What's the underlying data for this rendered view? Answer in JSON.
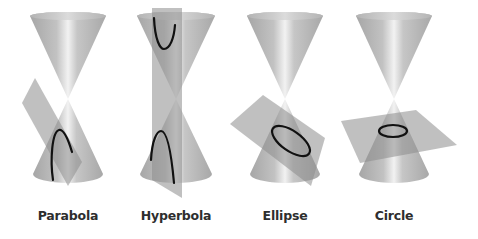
{
  "diagram": {
    "colors": {
      "background": "#ffffff",
      "cone_edge": "#a6a6a6",
      "cone_mid": "#c4c4c4",
      "cone_highlight": "#f2f2f2",
      "plane": "#8c8c8c",
      "plane_opacity": 0.55,
      "curve": "#111111",
      "label": "#2e2e2e"
    },
    "panels": [
      {
        "id": "parabola",
        "label": "Parabola",
        "center_x": 68,
        "cone": {
          "top_y": 16,
          "apex_y": 99,
          "bottom_y": 180,
          "half_width": 38
        },
        "plane": {
          "shape": "parallelogram",
          "points": [
            [
              35,
              78
            ],
            [
              22,
              103
            ],
            [
              68,
              186
            ],
            [
              82,
              162
            ]
          ]
        },
        "curve": {
          "type": "parabola",
          "path": "M53,180 C50,160 52,132 59,130 C64,129 69,142 72,152"
        }
      },
      {
        "id": "hyperbola",
        "label": "Hyperbola",
        "center_x": 176,
        "cone": {
          "top_y": 16,
          "apex_y": 99,
          "bottom_y": 180,
          "half_width": 39
        },
        "plane": {
          "shape": "vertical-strip",
          "points": [
            [
              152,
              8
            ],
            [
              182,
              8
            ],
            [
              182,
              198
            ],
            [
              152,
              180
            ]
          ]
        },
        "curve": {
          "type": "hyperbola",
          "upper_path": "M154,18 C155,40 160,49 164,49 C170,49 174,38 175,25",
          "lower_path": "M151,160 C152,140 157,131 161,131 C167,131 171,150 174,183"
        }
      },
      {
        "id": "ellipse",
        "label": "Ellipse",
        "center_x": 285,
        "cone": {
          "top_y": 16,
          "apex_y": 99,
          "bottom_y": 180,
          "half_width": 38
        },
        "plane": {
          "shape": "parallelogram",
          "points": [
            [
              263,
              95
            ],
            [
              230,
              124
            ],
            [
              311,
              186
            ],
            [
              325,
              138
            ]
          ]
        },
        "curve": {
          "type": "ellipse",
          "cx": 291,
          "cy": 141,
          "rx": 22,
          "ry": 10,
          "rotate": 35
        }
      },
      {
        "id": "circle",
        "label": "Circle",
        "center_x": 394,
        "cone": {
          "top_y": 16,
          "apex_y": 99,
          "bottom_y": 180,
          "half_width": 38
        },
        "plane": {
          "shape": "parallelogram",
          "points": [
            [
              341,
              121
            ],
            [
              416,
              110
            ],
            [
              457,
              145
            ],
            [
              360,
              163
            ]
          ]
        },
        "curve": {
          "type": "circle",
          "cx": 393,
          "cy": 131,
          "rx": 14,
          "ry": 6,
          "rotate": 0
        }
      }
    ]
  }
}
